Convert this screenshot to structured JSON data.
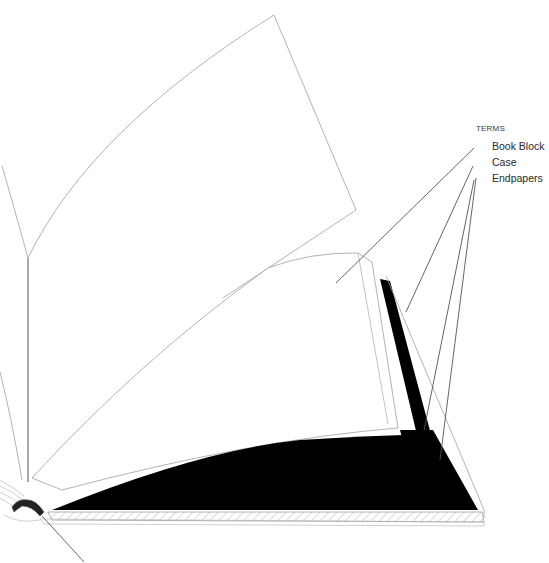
{
  "diagram": {
    "legend": {
      "title": "TERMS",
      "items": [
        {
          "label": "Book Block"
        },
        {
          "label": "Case"
        },
        {
          "label": "Endpapers"
        }
      ]
    },
    "colors": {
      "background": "#ffffff",
      "outline": "#9a9a9a",
      "leader": "#555555",
      "fill_dark": "#000000",
      "hatch": "#b0b0b0",
      "text": "#2a2a2a"
    }
  }
}
